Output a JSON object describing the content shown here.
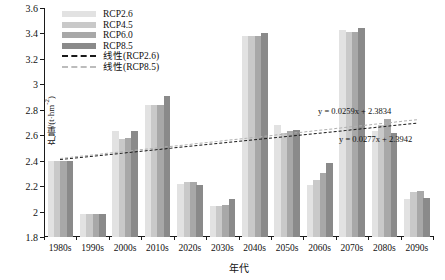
{
  "chart_data": {
    "type": "bar",
    "title": "",
    "xlabel": "年代",
    "ylabel": "产量/(t·hm-2)",
    "ylabel_display": "产量/(t·hm⁻²)",
    "ylim": [
      1.8,
      3.6
    ],
    "ytick_labels": [
      "1.8",
      "2",
      "2.2",
      "2.4",
      "2.6",
      "2.8",
      "3",
      "3.2",
      "3.4",
      "3.6"
    ],
    "ytick_values": [
      1.8,
      2.0,
      2.2,
      2.4,
      2.6,
      2.8,
      3.0,
      3.2,
      3.4,
      3.6
    ],
    "grid": false,
    "legend_position": "top-left",
    "categories": [
      "1980s",
      "1990s",
      "2000s",
      "2010s",
      "2020s",
      "2030s",
      "2040s",
      "2050s",
      "2060s",
      "2070s",
      "2080s",
      "2090s"
    ],
    "series": [
      {
        "name": "RCP2.6",
        "color": "#e2e2e2",
        "values": [
          2.4,
          1.98,
          2.63,
          2.84,
          2.22,
          2.04,
          3.38,
          2.68,
          2.21,
          3.43,
          2.63,
          2.1
        ]
      },
      {
        "name": "RCP4.5",
        "color": "#c9c9c9",
        "values": [
          2.4,
          1.98,
          2.57,
          2.84,
          2.23,
          2.04,
          3.38,
          2.62,
          2.25,
          3.41,
          2.68,
          2.15
        ]
      },
      {
        "name": "RCP6.0",
        "color": "#a8a8a8",
        "values": [
          2.4,
          1.98,
          2.58,
          2.84,
          2.23,
          2.05,
          3.38,
          2.63,
          2.3,
          3.41,
          2.73,
          2.16
        ]
      },
      {
        "name": "RCP8.5",
        "color": "#8a8a8a",
        "values": [
          2.4,
          1.98,
          2.63,
          2.91,
          2.21,
          2.1,
          3.4,
          2.64,
          2.38,
          3.44,
          2.62,
          2.11
        ]
      }
    ],
    "trendlines": [
      {
        "name": "线性(RCP2.6)",
        "equation": "y = 0.0259x + 2.3834",
        "slope": 0.0259,
        "intercept": 2.3834,
        "color": "#1a1a1a",
        "style": "dashed"
      },
      {
        "name": "线性(RCP8.5)",
        "equation": "y = 0.0277x + 2.3942",
        "slope": 0.0277,
        "intercept": 2.3942,
        "color": "#b0b0b0",
        "style": "dashed"
      }
    ],
    "annotations": [
      {
        "text": "y = 0.0259x + 2.3834",
        "x_px": 318,
        "y_px": 106
      },
      {
        "text": "y = 0.0277x + 2.3942",
        "x_px": 339,
        "y_px": 134
      }
    ]
  },
  "legend": {
    "entries": [
      {
        "label": "RCP2.6",
        "type": "swatch",
        "color": "#e2e2e2"
      },
      {
        "label": "RCP4.5",
        "type": "swatch",
        "color": "#c9c9c9"
      },
      {
        "label": "RCP6.0",
        "type": "swatch",
        "color": "#a8a8a8"
      },
      {
        "label": "RCP8.5",
        "type": "swatch",
        "color": "#8a8a8a"
      },
      {
        "label": "线性(RCP2.6)",
        "type": "dash",
        "color": "#1a1a1a"
      },
      {
        "label": "线性(RCP8.5)",
        "type": "dash",
        "color": "#bcbcbc"
      }
    ]
  }
}
